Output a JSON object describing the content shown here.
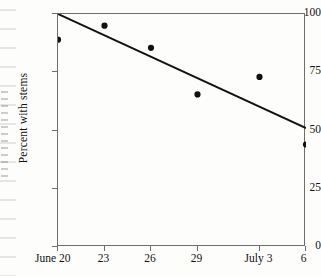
{
  "chart_data": {
    "type": "scatter",
    "title": "",
    "subtitle": "",
    "xlabel": "",
    "ylabel": "Percent with stems",
    "ylim": [
      0,
      100
    ],
    "yticks": [
      0,
      25,
      50,
      75,
      100
    ],
    "ytick_labels": [
      "0",
      "25",
      "50",
      "75",
      "100"
    ],
    "xtick_labels": [
      "June 20",
      "23",
      "26",
      "29",
      "July 3",
      "6"
    ],
    "xtick_months": [
      "June",
      "",
      "",
      "",
      "July",
      ""
    ],
    "xtick_days": [
      "20",
      "23",
      "26",
      "29",
      "3",
      "6"
    ],
    "xlim_days": [
      0,
      16
    ],
    "x_day_offsets": [
      0,
      3,
      6,
      9,
      13,
      16
    ],
    "grid": false,
    "legend": false,
    "legend_position": "none",
    "marker": "filled-circle",
    "marker_color": "#111111",
    "line_color": "#111111",
    "axis_color": "#6e6e6e",
    "background_color": "#fdfdfb",
    "series": [
      {
        "name": "Percent with stems",
        "type": "scatter",
        "x_labels": [
          "June 20",
          "June 23",
          "June 26",
          "June 29",
          "July 3",
          "July 6"
        ],
        "x": [
          0,
          3,
          6,
          9,
          13,
          16
        ],
        "values": [
          89,
          95,
          85.5,
          65.5,
          73,
          44
        ]
      },
      {
        "name": "Fitted regression line",
        "type": "line",
        "x": [
          0,
          16
        ],
        "values": [
          100,
          51
        ]
      }
    ]
  }
}
